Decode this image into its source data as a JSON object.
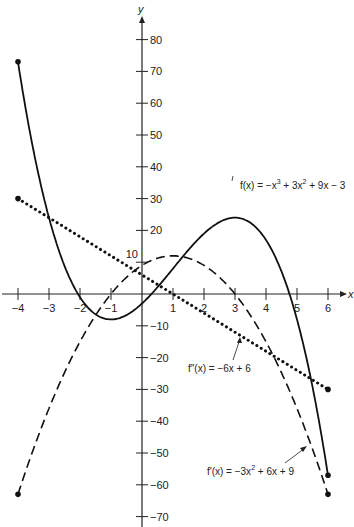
{
  "chart_data": {
    "type": "line",
    "title": "",
    "xlabel": "x",
    "ylabel": "y",
    "xlim": [
      -4,
      6
    ],
    "ylim": [
      -70,
      80
    ],
    "x_ticks": [
      -4,
      -3,
      -2,
      -1,
      1,
      2,
      3,
      4,
      5,
      6
    ],
    "y_ticks": [
      80,
      70,
      60,
      50,
      40,
      30,
      20,
      10,
      -10,
      -20,
      -30,
      -40,
      -50,
      -60,
      -70
    ],
    "grid": false,
    "series": [
      {
        "name": "f(x) = −x³ + 3x² + 9x − 3",
        "style": "solid",
        "formula": "-x^3+3x^2+9x-3",
        "x": [
          -4,
          -3,
          -2,
          -1,
          0,
          1,
          2,
          3,
          4,
          5,
          6
        ],
        "values": [
          73,
          24,
          -1,
          -8,
          -3,
          8,
          19,
          24,
          17,
          -8,
          -57
        ]
      },
      {
        "name": "f′(x) = −3x² + 6x + 9",
        "style": "dashed",
        "formula": "-3x^2+6x+9",
        "x": [
          -4,
          -3,
          -2,
          -1,
          0,
          1,
          2,
          3,
          4,
          5,
          6
        ],
        "values": [
          -63,
          -36,
          -15,
          0,
          9,
          12,
          9,
          0,
          -15,
          -36,
          -63
        ]
      },
      {
        "name": "f″(x) = −6x + 6",
        "style": "dotted",
        "formula": "-6x+6",
        "x": [
          -4,
          6
        ],
        "values": [
          30,
          -30
        ]
      }
    ],
    "annotations": [
      "f(x) = −x³ + 3x² + 9x − 3",
      "f″(x) = −6x + 6",
      "f′(x) = −3x² + 6x + 9"
    ]
  },
  "labels": {
    "x_axis": "x",
    "y_axis": "y",
    "f_eq": {
      "base": "f(x) = −x",
      "sup1": "3",
      "mid": " + 3x",
      "sup2": "2",
      "end": " + 9x − 3"
    },
    "fpp_eq": "f″(x) = −6x + 6",
    "fp_eq": {
      "base": "f′(x) = −3x",
      "sup1": "2",
      "end": " + 6x + 9"
    }
  }
}
